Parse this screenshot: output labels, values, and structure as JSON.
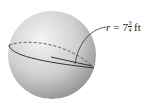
{
  "figure": {
    "type": "sphere",
    "colors": {
      "sphere_light": "#f2f2f2",
      "sphere_dark": "#9a9a9a",
      "line": "#333333"
    }
  },
  "label": {
    "variable": "r",
    "equals": "=",
    "whole": "7",
    "numerator": "3",
    "denominator": "4",
    "unit": "ft"
  }
}
